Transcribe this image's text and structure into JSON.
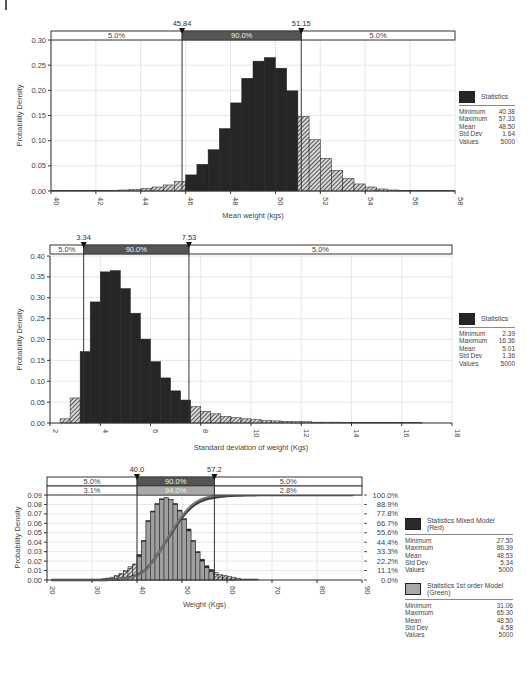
{
  "chart_data": [
    {
      "type": "bar",
      "title": "",
      "xlabel": "Mean weight (kgs)",
      "ylabel": "Probability Density",
      "xlim": [
        40,
        58
      ],
      "ylim": [
        0,
        0.3
      ],
      "xticks": [
        "40",
        "42",
        "44",
        "46",
        "48",
        "50",
        "52",
        "54",
        "56",
        "58"
      ],
      "yticks": [
        "0.00",
        "0.05",
        "0.10",
        "0.15",
        "0.20",
        "0.25",
        "0.30"
      ],
      "grid": true,
      "markers": {
        "left": "45.84",
        "right": "51.15"
      },
      "bands": [
        {
          "left": "5.0%",
          "middle": "90.0%",
          "right": "5.0%"
        }
      ],
      "bin_width": 0.5,
      "bins_start": 40.0,
      "values": [
        0.001,
        0.001,
        0.001,
        0.001,
        0.001,
        0.001,
        0.002,
        0.003,
        0.005,
        0.008,
        0.012,
        0.019,
        0.032,
        0.053,
        0.082,
        0.124,
        0.175,
        0.224,
        0.258,
        0.265,
        0.244,
        0.199,
        0.148,
        0.102,
        0.065,
        0.041,
        0.025,
        0.014,
        0.008,
        0.004,
        0.002,
        0.001,
        0.001,
        0.001,
        0.001,
        0.001
      ],
      "legend": {
        "title": "Statistics",
        "rows": [
          [
            "Minimum",
            "40.38"
          ],
          [
            "Maximum",
            "57.33"
          ],
          [
            "Mean",
            "48.50"
          ],
          [
            "Std Dev",
            "1.64"
          ],
          [
            "Values",
            "5000"
          ]
        ]
      }
    },
    {
      "type": "bar",
      "title": "",
      "xlabel": "Standard deviation of weight (Kgs)",
      "ylabel": "Probability Density",
      "xlim": [
        2,
        18
      ],
      "ylim": [
        0,
        0.4
      ],
      "xticks": [
        "2",
        "4",
        "6",
        "8",
        "10",
        "12",
        "14",
        "16",
        "18"
      ],
      "yticks": [
        "0.00",
        "0.05",
        "0.10",
        "0.15",
        "0.20",
        "0.25",
        "0.30",
        "0.35",
        "0.40"
      ],
      "grid": true,
      "markers": {
        "left": "3.34",
        "right": "7.53"
      },
      "bands": [
        {
          "left": "5.0%",
          "middle": "90.0%",
          "right": "5.0%"
        }
      ],
      "bin_width": 0.4,
      "bins_start": 2.4,
      "values": [
        0.01,
        0.06,
        0.171,
        0.29,
        0.362,
        0.365,
        0.322,
        0.263,
        0.201,
        0.147,
        0.108,
        0.077,
        0.055,
        0.039,
        0.028,
        0.022,
        0.016,
        0.013,
        0.01,
        0.008,
        0.006,
        0.005,
        0.004,
        0.003,
        0.003,
        0.002,
        0.002,
        0.002,
        0.001,
        0.001,
        0.001,
        0.001,
        0.001,
        0.001,
        0.001,
        0.001
      ],
      "legend": {
        "title": "Statistics",
        "rows": [
          [
            "Minimum",
            "2.39"
          ],
          [
            "Maximum",
            "16.36"
          ],
          [
            "Mean",
            "5.01"
          ],
          [
            "Std Dev",
            "1.36"
          ],
          [
            "Values",
            "5000"
          ]
        ]
      }
    },
    {
      "type": "bar",
      "title": "",
      "xlabel": "Weight (Kgs)",
      "ylabel": "Probability Density",
      "xlim": [
        20,
        90
      ],
      "ylim": [
        0,
        0.09
      ],
      "xticks": [
        "20",
        "30",
        "40",
        "50",
        "60",
        "70",
        "80",
        "90"
      ],
      "yticks": [
        "0.00",
        "0.01",
        "0.02",
        "0.03",
        "0.04",
        "0.05",
        "0.06",
        "0.07",
        "0.08",
        "0.09"
      ],
      "y2ticks": [
        "0.0%",
        "11.1%",
        "22.2%",
        "33.3%",
        "44.4%",
        "55.6%",
        "66.7%",
        "77.8%",
        "88.9%",
        "100.0%"
      ],
      "grid": true,
      "markers": {
        "left": "40.0",
        "right": "57.2"
      },
      "bands": [
        {
          "left": "5.0%",
          "middle": "90.0%",
          "right": "5.0%"
        },
        {
          "left": "3.1%",
          "middle": "94.0%",
          "right": "2.8%"
        }
      ],
      "bin_width": 1,
      "bins_start": 20,
      "series": [
        {
          "name": "Statistics Mixed Model (Red)",
          "values": [
            0,
            0,
            0,
            0,
            0,
            0,
            0,
            0,
            0,
            0,
            0,
            0,
            0.001,
            0.002,
            0.003,
            0.005,
            0.007,
            0.01,
            0.014,
            0.017,
            0.027,
            0.042,
            0.063,
            0.073,
            0.081,
            0.086,
            0.087,
            0.085,
            0.081,
            0.074,
            0.065,
            0.054,
            0.042,
            0.03,
            0.022,
            0.015,
            0.011,
            0.008,
            0.006,
            0.005,
            0.004,
            0.003,
            0.002,
            0.001,
            0.001,
            0.001,
            0.001,
            0,
            0,
            0,
            0,
            0,
            0,
            0,
            0,
            0,
            0,
            0,
            0,
            0,
            0,
            0,
            0,
            0,
            0,
            0,
            0,
            0
          ]
        },
        {
          "name": "Statistics 1st order Model (Green)",
          "values": [
            0,
            0,
            0,
            0,
            0,
            0,
            0,
            0,
            0,
            0,
            0,
            0,
            0.001,
            0.001,
            0.002,
            0.004,
            0.006,
            0.009,
            0.012,
            0.016,
            0.025,
            0.041,
            0.062,
            0.072,
            0.08,
            0.085,
            0.087,
            0.085,
            0.08,
            0.073,
            0.064,
            0.052,
            0.041,
            0.029,
            0.02,
            0.013,
            0.009,
            0.006,
            0.003,
            0.002,
            0.001,
            0.001,
            0,
            0,
            0,
            0,
            0,
            0,
            0,
            0,
            0,
            0,
            0,
            0,
            0,
            0,
            0,
            0,
            0,
            0,
            0,
            0,
            0,
            0,
            0,
            0,
            0,
            0
          ]
        }
      ],
      "legends": [
        {
          "title": "Statistics Mixed Model (Red)",
          "color": "#2a2a2a",
          "rows": [
            [
              "Minimum",
              "27.50"
            ],
            [
              "Maximum",
              "86.39"
            ],
            [
              "Mean",
              "48.53"
            ],
            [
              "Std Dev",
              "5.34"
            ],
            [
              "Values",
              "5000"
            ]
          ]
        },
        {
          "title": "Statistics 1st order Model (Green)",
          "color": "#a9a9a9",
          "rows": [
            [
              "Minimum",
              "31.06"
            ],
            [
              "Maximum",
              "65.30"
            ],
            [
              "Mean",
              "48.50"
            ],
            [
              "Std Dev",
              "4.58"
            ],
            [
              "Values",
              "5000"
            ]
          ]
        }
      ]
    }
  ],
  "colors": {
    "bar_dark": "#262626",
    "bar_light": "#a6a6a6",
    "band_dark": "#555555",
    "band_light": "#a8a8a8",
    "grid": "#e6e6e6"
  }
}
